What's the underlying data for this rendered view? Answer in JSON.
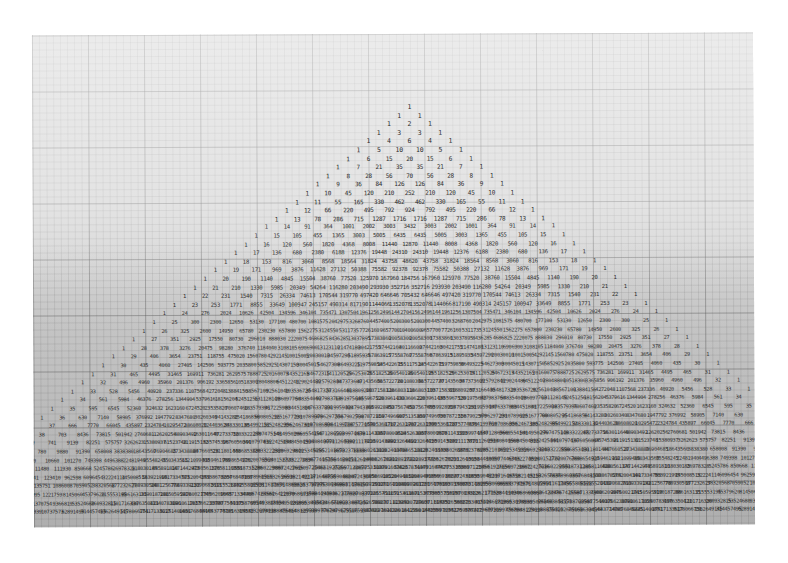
{
  "image": {
    "subject": "Handwritten Pascal's triangle on graph paper",
    "background_color": "#ffffff",
    "paper_color": "#d4d4d4",
    "ink_color": "#2b2b2b"
  },
  "triangle": {
    "rows_drawn": 48,
    "apex_x": 377,
    "apex_y": 70,
    "row_spacing_px": 8.6,
    "column_spacing_px": 20.5,
    "visible_rows_sample": [
      [
        "1"
      ],
      [
        "1",
        "1"
      ],
      [
        "1",
        "2",
        "1"
      ],
      [
        "1",
        "3",
        "3",
        "1"
      ],
      [
        "1",
        "4",
        "6",
        "4",
        "1"
      ],
      [
        "1",
        "5",
        "10",
        "10",
        "5",
        "1"
      ],
      [
        "1",
        "6",
        "15",
        "20",
        "15",
        "6",
        "1"
      ],
      [
        "1",
        "7",
        "21",
        "35",
        "35",
        "21",
        "7",
        "1"
      ],
      [
        "1",
        "8",
        "28",
        "56",
        "70",
        "56",
        "28",
        "8",
        "1"
      ],
      [
        "1",
        "9",
        "36",
        "84",
        "126",
        "126",
        "84",
        "36",
        "9",
        "1"
      ],
      [
        "1",
        "10",
        "45",
        "120",
        "210",
        "252",
        "210",
        "120",
        "45",
        "10",
        "1"
      ],
      [
        "1",
        "11",
        "55",
        "165",
        "330",
        "462",
        "462",
        "330",
        "165",
        "55",
        "11",
        "1"
      ],
      [
        "1",
        "12",
        "66",
        "220",
        "495",
        "792",
        "924",
        "792",
        "495",
        "220",
        "66",
        "12",
        "1"
      ],
      [
        "1",
        "13",
        "78",
        "286",
        "715",
        "1287",
        "1716",
        "1716",
        "1287",
        "715",
        "286",
        "78",
        "13",
        "1"
      ],
      [
        "1",
        "14",
        "91",
        "364",
        "1001",
        "2002",
        "3003",
        "3432",
        "3003",
        "2002",
        "1001",
        "364",
        "91",
        "14",
        "1"
      ],
      [
        "1",
        "15",
        "105",
        "455",
        "1365",
        "3003",
        "5005",
        "6435",
        "6435",
        "5005",
        "3003",
        "1365",
        "455",
        "105",
        "15",
        "1"
      ],
      [
        "1",
        "16",
        "120",
        "560",
        "1820",
        "4368",
        "8008",
        "11440",
        "12870",
        "11440",
        "8008",
        "4368",
        "1820",
        "560",
        "120",
        "16",
        "1"
      ]
    ],
    "notable_center_values": [
      "252",
      "924",
      "3432",
      "12870",
      "48620",
      "184756",
      "705432",
      "2704156",
      "5200300",
      "40116600"
    ]
  }
}
